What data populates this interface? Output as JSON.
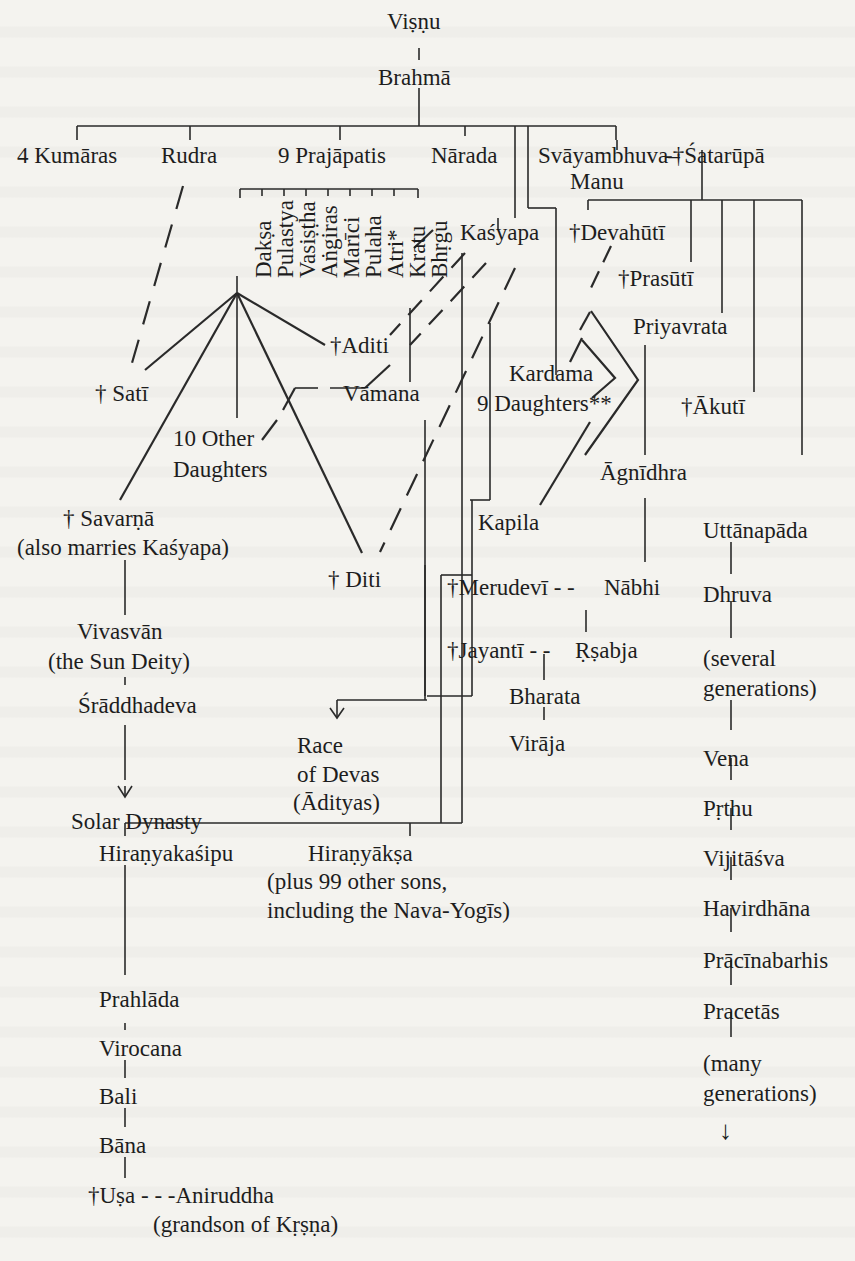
{
  "diagram": {
    "type": "genealogy-tree",
    "root": "Viṣṇu",
    "nodes": {
      "visnu": "Viṣṇu",
      "brahma": "Brahmā",
      "kumaras": "4 Kumāras",
      "rudra": "Rudra",
      "prajapatis": "9 Prajāpatis",
      "narada": "Nārada",
      "svayambhuva": "Svāyambhuva–",
      "manu": "Manu",
      "satarupa": "-†Śatarūpā",
      "prajapati_list": [
        "Dakṣa",
        "Pulastya",
        "Vasiṣṭha",
        "Aṅgiras",
        "Marīci",
        "Pulaha",
        "Atri*",
        "Kratu",
        "Bhṛgu"
      ],
      "kasyapa": "Kaśyapa",
      "devahuti": "†Devahūtī",
      "prasuti": "†Prasūtī",
      "priyavrata": "Priyavrata",
      "aditi": "†Aditi",
      "vamana": "Vāmana",
      "sati": "† Satī",
      "kardama": "Kardama",
      "nine_daughters": "9 Daughters**",
      "akuti": "†Ākutī",
      "other_daughters_1": "10 Other",
      "other_daughters_2": "Daughters",
      "agnidhra": "Āgnīdhra",
      "savarna": "† Savarṇā",
      "savarna_note": "(also marries Kaśyapa)",
      "kapila": "Kapila",
      "uttanapada": "Uttānapāda",
      "diti": "† Diti",
      "merudevi": "†Merudevī - -",
      "nabhi": "Nābhi",
      "dhruva": "Dhruva",
      "vivasvan": "Vivasvān",
      "vivasvan_note": "(the Sun Deity)",
      "jayanti": "†Jayantī - -",
      "rsabha": "Ṛṣabja",
      "several_1": "(several",
      "several_2": "generations)",
      "sraddhadeva": "Śrāddhadeva",
      "bharata": "Bharata",
      "viraja": "Virāja",
      "race_1": "Race",
      "race_2": "of Devas",
      "race_3": "(Ādityas)",
      "vena": "Vena",
      "solar": "Solar Dynasty",
      "prthu": "Pṛthu",
      "hiranyakasipu": "Hiraṇyakaśipu",
      "hiranyaksa": "Hiraṇyākṣa",
      "hiranyaksa_note_1": "(plus 99 other sons,",
      "hiranyaksa_note_2": "including the Nava-Yogīs)",
      "vijitasva": "Vijitāśva",
      "havirdhana": "Havirdhāna",
      "prahlada": "Prahlāda",
      "pracinabarhis": "Prācīnabarhis",
      "virocana": "Virocana",
      "pracetas": "Pracetās",
      "bali": "Bali",
      "many_1": "(many",
      "many_2": "generations)",
      "bana": "Bāna",
      "usa": "†Uṣa - - -Aniruddha",
      "krsna_note": "(grandson of Kṛṣṇa)"
    },
    "legend": {
      "dagger": "† = female",
      "solid_line": "descent",
      "dashed_line": "marriage"
    },
    "arrow_down_icon": "↓"
  }
}
